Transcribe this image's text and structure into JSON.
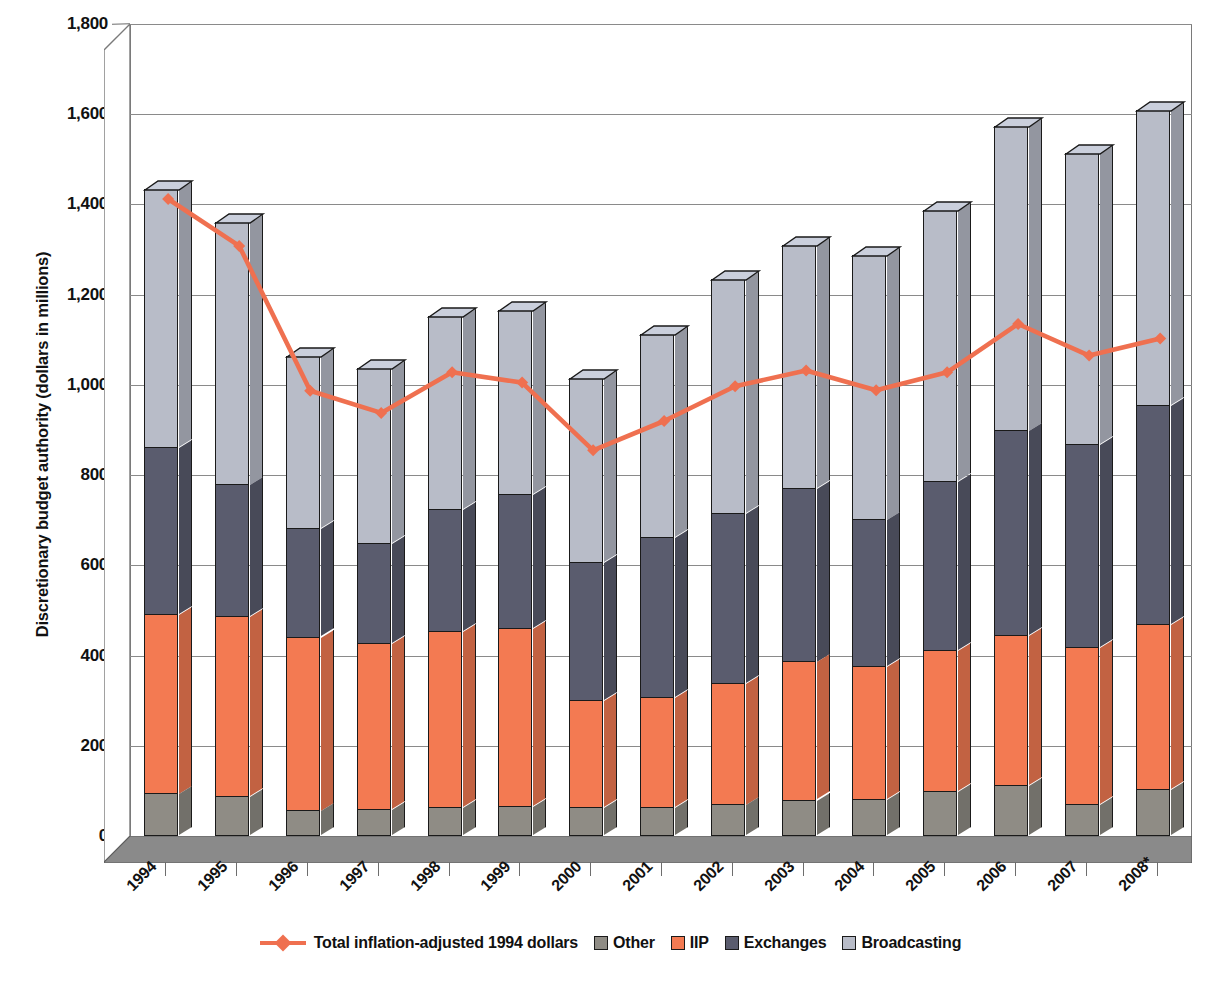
{
  "chart_data": {
    "type": "bar",
    "subtype": "stacked-column-3d-with-line-overlay",
    "title": "",
    "xlabel": "",
    "ylabel": "Discretionary budget authority (dollars in millions)",
    "ylim": [
      0,
      1800
    ],
    "ytick_step": 200,
    "ytick_labels": [
      "0",
      "200",
      "400",
      "600",
      "800",
      "1,000",
      "1,200",
      "1,400",
      "1,600",
      "1,800"
    ],
    "ytick_values": [
      0,
      200,
      400,
      600,
      800,
      1000,
      1200,
      1400,
      1600,
      1800
    ],
    "grid": true,
    "legend_position": "bottom",
    "categories": [
      "1994",
      "1995",
      "1996",
      "1997",
      "1998",
      "1999",
      "2000",
      "2001",
      "2002",
      "2003",
      "2004",
      "2005",
      "2006",
      "2007",
      "2008*"
    ],
    "series": [
      {
        "name": "Other",
        "type": "bar",
        "color": "#8f8c85",
        "values": [
          95,
          88,
          57,
          60,
          65,
          67,
          65,
          65,
          70,
          80,
          82,
          100,
          112,
          72,
          105
        ]
      },
      {
        "name": "IIP",
        "type": "bar",
        "color": "#f37a52",
        "values": [
          398,
          400,
          385,
          367,
          390,
          395,
          237,
          243,
          270,
          307,
          295,
          313,
          333,
          348,
          365
        ]
      },
      {
        "name": "Exchanges",
        "type": "bar",
        "color": "#5a5c6e",
        "values": [
          370,
          292,
          240,
          222,
          270,
          297,
          305,
          355,
          377,
          385,
          325,
          375,
          455,
          450,
          485
        ]
      },
      {
        "name": "Broadcasting",
        "type": "bar",
        "color": "#b8bcc8",
        "values": [
          572,
          582,
          382,
          388,
          428,
          408,
          408,
          450,
          518,
          538,
          587,
          600,
          675,
          645,
          655
        ]
      },
      {
        "name": "Total inflation-adjusted 1994 dollars",
        "type": "line",
        "color": "#ef7050",
        "values": [
          1412,
          1308,
          987,
          938,
          1028,
          1005,
          855,
          920,
          997,
          1032,
          988,
          1028,
          1135,
          1065,
          1103
        ]
      }
    ],
    "totals": [
      1435,
      1362,
      1064,
      1037,
      1153,
      1167,
      1015,
      1113,
      1235,
      1310,
      1289,
      1388,
      1575,
      1515,
      1610
    ]
  },
  "legend": {
    "items": [
      {
        "label": "Total inflation-adjusted 1994 dollars",
        "marker": "line",
        "color": "#ef7050"
      },
      {
        "label": "Other",
        "marker": "swatch",
        "color": "#8f8c85"
      },
      {
        "label": "IIP",
        "marker": "swatch",
        "color": "#f37a52"
      },
      {
        "label": "Exchanges",
        "marker": "swatch",
        "color": "#5a5c6e"
      },
      {
        "label": "Broadcasting",
        "marker": "swatch",
        "color": "#b8bcc8"
      }
    ]
  },
  "colors": {
    "other": "#8f8c85",
    "iip": "#f37a52",
    "exchanges": "#5a5c6e",
    "broadcasting": "#b8bcc8",
    "line": "#ef7050",
    "axis": "#6d6d6d",
    "grid": "#8a8a8a",
    "outline": "#1a1a1a",
    "floor": "#8a8a8a"
  }
}
